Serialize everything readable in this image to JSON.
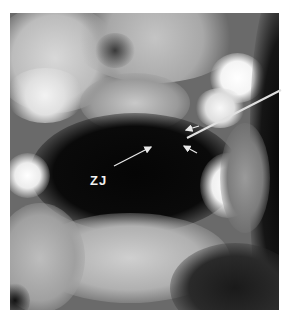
{
  "figure": {
    "type": "dental radiograph (panoramic X-ray)",
    "annotations": [
      {
        "label": "ZJ",
        "arrow_count": 1
      }
    ],
    "unlabeled_arrows": 3,
    "pointer_line": 1
  }
}
